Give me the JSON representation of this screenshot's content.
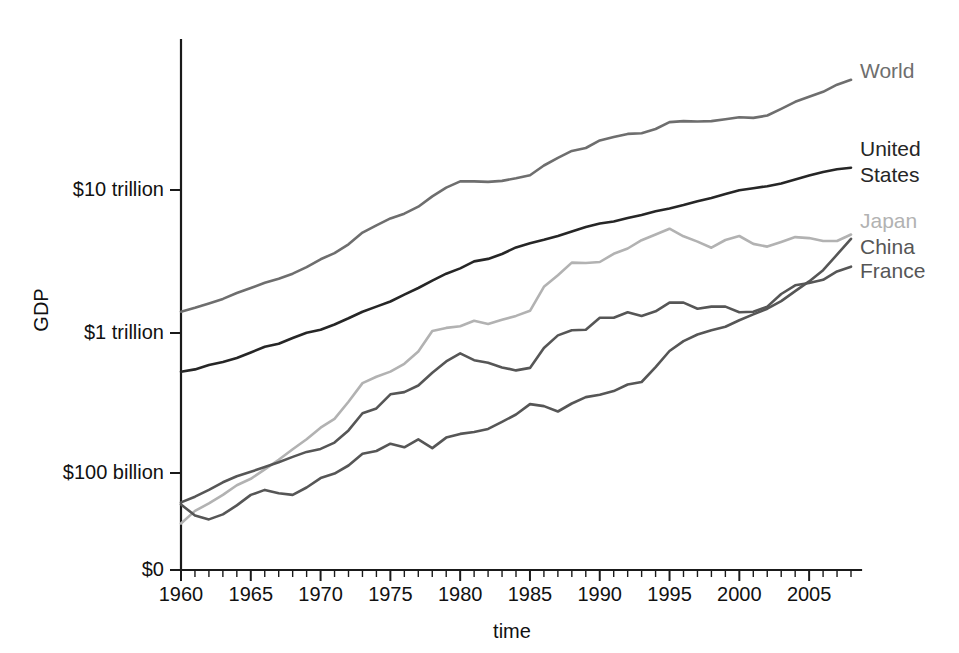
{
  "chart_data": {
    "type": "line",
    "title": "",
    "xlabel": "time",
    "ylabel": "GDP",
    "scale_y": "log",
    "grid": false,
    "legend_position": "right-inline-labels",
    "xlim": [
      1960,
      2008
    ],
    "ylim_note": "log axis, baseline drawn at $0 label",
    "x_tick_labels": [
      "1960",
      "1965",
      "1970",
      "1975",
      "1980",
      "1985",
      "1990",
      "1995",
      "2000",
      "2005"
    ],
    "x_tick_values": [
      1960,
      1965,
      1970,
      1975,
      1980,
      1985,
      1990,
      1995,
      2000,
      2005
    ],
    "x_minor_step_years": 1,
    "y_tick_labels": [
      "$10 trillion",
      "$1 trillion",
      "$100 billion",
      "$0"
    ],
    "y_tick_values": [
      10000,
      1000,
      100,
      0
    ],
    "y_units": "billions of US dollars",
    "x": [
      1960,
      1961,
      1962,
      1963,
      1964,
      1965,
      1966,
      1967,
      1968,
      1969,
      1970,
      1971,
      1972,
      1973,
      1974,
      1975,
      1976,
      1977,
      1978,
      1979,
      1980,
      1981,
      1982,
      1983,
      1984,
      1985,
      1986,
      1987,
      1988,
      1989,
      1990,
      1991,
      1992,
      1993,
      1994,
      1995,
      1996,
      1997,
      1998,
      1999,
      2000,
      2001,
      2002,
      2003,
      2004,
      2005,
      2006,
      2007,
      2008
    ],
    "series": [
      {
        "name": "World",
        "color": "#6e6e6e",
        "values": [
          1380,
          1470,
          1580,
          1700,
          1870,
          2030,
          2210,
          2360,
          2560,
          2850,
          3240,
          3580,
          4130,
          5000,
          5630,
          6300,
          6800,
          7620,
          9010,
          10400,
          11500,
          11500,
          11400,
          11600,
          12100,
          12700,
          14900,
          16900,
          18900,
          19800,
          22400,
          23700,
          24900,
          25200,
          27000,
          30200,
          30700,
          30500,
          30700,
          31600,
          32700,
          32300,
          33600,
          37500,
          42000,
          45600,
          49400,
          55500,
          60100
        ]
      },
      {
        "name": "United States",
        "color": "#262626",
        "values": [
          520,
          540,
          580,
          610,
          650,
          710,
          780,
          820,
          900,
          980,
          1030,
          1120,
          1240,
          1380,
          1500,
          1630,
          1820,
          2030,
          2290,
          2560,
          2790,
          3130,
          3260,
          3530,
          3930,
          4210,
          4450,
          4740,
          5100,
          5480,
          5800,
          5990,
          6340,
          6670,
          7080,
          7410,
          7840,
          8330,
          8790,
          9350,
          9950,
          10290,
          10640,
          11140,
          11860,
          12640,
          13400,
          14030,
          14370
        ]
      },
      {
        "name": "Japan",
        "color": "#b2b2b2",
        "values": [
          44,
          54,
          61,
          70,
          82,
          91,
          106,
          124,
          147,
          173,
          209,
          241,
          319,
          432,
          479,
          521,
          591,
          721,
          1010,
          1060,
          1090,
          1190,
          1130,
          1210,
          1290,
          1400,
          2070,
          2500,
          3070,
          3050,
          3100,
          3540,
          3860,
          4420,
          4850,
          5330,
          4710,
          4320,
          3910,
          4430,
          4730,
          4160,
          3980,
          4300,
          4650,
          4570,
          4360,
          4360,
          4850
        ]
      },
      {
        "name": "China",
        "color": "#565656",
        "values": [
          60,
          50,
          47,
          51,
          59,
          70,
          76,
          72,
          70,
          79,
          92,
          99,
          113,
          137,
          143,
          161,
          152,
          173,
          150,
          178,
          189,
          195,
          205,
          230,
          259,
          307,
          297,
          272,
          310,
          344,
          357,
          379,
          422,
          440,
          559,
          728,
          856,
          952,
          1020,
          1080,
          1200,
          1320,
          1450,
          1640,
          1930,
          2260,
          2710,
          3490,
          4520
        ]
      },
      {
        "name": "France",
        "color": "#565656",
        "values": [
          62,
          68,
          76,
          86,
          95,
          102,
          110,
          119,
          130,
          141,
          148,
          164,
          200,
          264,
          286,
          360,
          373,
          415,
          511,
          615,
          700,
          627,
          601,
          558,
          531,
          553,
          764,
          938,
          1020,
          1030,
          1250,
          1250,
          1370,
          1290,
          1390,
          1600,
          1600,
          1450,
          1500,
          1500,
          1370,
          1380,
          1500,
          1840,
          2120,
          2200,
          2320,
          2660,
          2870
        ]
      }
    ],
    "series_labels": [
      {
        "name": "World",
        "text": "World",
        "color": "#6e6e6e"
      },
      {
        "name": "United States",
        "text_line1": "United",
        "text_line2": "States",
        "color": "#262626"
      },
      {
        "name": "Japan",
        "text": "Japan",
        "color": "#b2b2b2"
      },
      {
        "name": "China",
        "text": "China",
        "color": "#565656"
      },
      {
        "name": "France",
        "text": "France",
        "color": "#565656"
      }
    ]
  }
}
